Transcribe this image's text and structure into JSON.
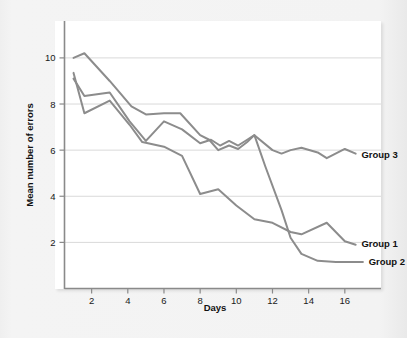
{
  "figure": {
    "background_color": "#f2f2f2",
    "panel_color": "#ffffff"
  },
  "chart_data": {
    "type": "line",
    "title": "",
    "subtitle": "",
    "xlabel": "Days",
    "ylabel": "Mean number of errors",
    "xlim": [
      0.5,
      18.0
    ],
    "ylim": [
      0.0,
      11.6
    ],
    "xticks": [
      2,
      4,
      6,
      8,
      10,
      12,
      14,
      16
    ],
    "xtick_labels": [
      "2",
      "4",
      "6",
      "8",
      "10",
      "12",
      "14",
      "16"
    ],
    "yticks": [
      2,
      4,
      6,
      8,
      10
    ],
    "ytick_labels": [
      "2",
      "4",
      "6",
      "8",
      "10"
    ],
    "grid": "horizontal",
    "grid_color": "#d9d9d9",
    "line_color": "#8c8c8c",
    "line_width": 2.0,
    "legend_position": "end-of-line",
    "x": [
      1,
      2,
      3,
      4,
      5,
      6,
      7,
      8,
      9,
      10,
      11,
      12,
      13,
      14,
      15,
      16,
      17
    ],
    "series": [
      {
        "name": "Group 1",
        "label": "Group 1",
        "color": "#8c8c8c",
        "values": [
          9.1,
          8.3,
          8.5,
          7.5,
          6.8,
          7.3,
          6.9,
          6.4,
          6.4,
          6.2,
          5.6,
          4.6,
          3.6,
          2.9,
          3.1,
          2.4,
          2.0
        ]
      },
      {
        "name": "Group 2",
        "label": "Group 2",
        "color": "#9a9a9a",
        "values": [
          10.0,
          10.2,
          9.0,
          8.0,
          7.6,
          7.6,
          7.6,
          6.9,
          6.3,
          6.3,
          6.6,
          4.4,
          2.2,
          1.5,
          1.3,
          1.3,
          1.3
        ]
      },
      {
        "name": "Group 3",
        "label": "Group 3",
        "color": "#8c8c8c",
        "values": [
          9.3,
          7.6,
          8.2,
          7.5,
          6.4,
          6.2,
          5.8,
          4.2,
          4.3,
          3.9,
          3.5,
          3.1,
          2.6,
          2.5,
          2.9,
          2.4,
          2.0
        ]
      }
    ],
    "series_render": [
      {
        "name": "Group 2",
        "points": [
          [
            1,
            10.0
          ],
          [
            1.6,
            10.2
          ],
          [
            3,
            9.0
          ],
          [
            4.2,
            7.9
          ],
          [
            5,
            7.55
          ],
          [
            6,
            7.6
          ],
          [
            6.9,
            7.6
          ],
          [
            8,
            6.65
          ],
          [
            8.5,
            6.45
          ],
          [
            9,
            6.0
          ],
          [
            9.6,
            6.2
          ],
          [
            10.1,
            6.05
          ],
          [
            10.6,
            6.35
          ],
          [
            11,
            6.65
          ],
          [
            11.6,
            5.3
          ],
          [
            12.5,
            3.4
          ],
          [
            13,
            2.2
          ],
          [
            13.6,
            1.5
          ],
          [
            14.5,
            1.2
          ],
          [
            15.5,
            1.15
          ],
          [
            17,
            1.15
          ]
        ],
        "label": "Group 2",
        "label_x": 17.15,
        "label_y": 1.15
      },
      {
        "name": "Group 1-top",
        "points": [
          [
            1,
            9.1
          ],
          [
            1.6,
            8.35
          ],
          [
            3,
            8.5
          ],
          [
            4.1,
            7.25
          ],
          [
            5,
            6.4
          ],
          [
            6,
            7.25
          ],
          [
            7,
            6.9
          ],
          [
            8,
            6.3
          ],
          [
            8.6,
            6.45
          ],
          [
            9.1,
            6.2
          ],
          [
            9.6,
            6.4
          ],
          [
            10.1,
            6.2
          ],
          [
            10.6,
            6.45
          ],
          [
            11,
            6.65
          ],
          [
            12,
            6.0
          ],
          [
            12.5,
            5.85
          ],
          [
            13,
            6.0
          ],
          [
            13.6,
            6.1
          ],
          [
            14.5,
            5.9
          ],
          [
            15,
            5.65
          ],
          [
            16,
            6.05
          ],
          [
            16.6,
            5.85
          ]
        ],
        "label": "Group 3",
        "label_x": 16.75,
        "label_y": 5.8
      },
      {
        "name": "Group 3-low",
        "points": [
          [
            1,
            9.35
          ],
          [
            1.6,
            7.6
          ],
          [
            3,
            8.15
          ],
          [
            4.1,
            7.1
          ],
          [
            4.8,
            6.35
          ],
          [
            6,
            6.15
          ],
          [
            7,
            5.75
          ],
          [
            8,
            4.1
          ],
          [
            9,
            4.3
          ],
          [
            10,
            3.6
          ],
          [
            11,
            3.0
          ],
          [
            12,
            2.85
          ],
          [
            13,
            2.45
          ],
          [
            13.6,
            2.35
          ],
          [
            15,
            2.85
          ],
          [
            16,
            2.05
          ],
          [
            16.6,
            1.9
          ]
        ],
        "label": "Group 1",
        "label_x": 16.75,
        "label_y": 1.95
      }
    ]
  },
  "axes": {
    "y_axis_title": "Mean number of errors",
    "x_axis_title": "Days"
  },
  "labels": {
    "group3": "Group 3",
    "group1": "Group 1",
    "group2": "Group 2"
  }
}
